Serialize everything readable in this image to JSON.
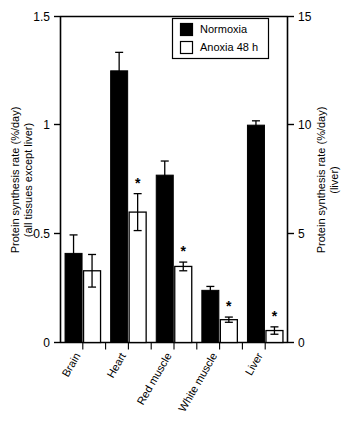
{
  "chart_data": {
    "type": "bar",
    "title": "",
    "xlabel": "",
    "ylabel": "Protein synthesis rate (%/day) (all tissues except liver)",
    "ylabel_line1": "Protein synthesis rate (%/day)",
    "ylabel_line2": "(all tissues except liver)",
    "y2label": "Protein synthesis rate (%/day) (liver)",
    "y2label_line1": "Protein synthesis rate (%/day)",
    "y2label_line2": "(liver)",
    "categories": [
      "Brain",
      "Heart",
      "Red muscle",
      "White muscle",
      "Liver"
    ],
    "ylim": [
      0,
      1.5
    ],
    "y2lim": [
      0,
      15
    ],
    "yticks": [
      "0",
      "0.5",
      "1",
      "1.5"
    ],
    "ytick_values": [
      0,
      0.5,
      1,
      1.5
    ],
    "y2ticks": [
      "0",
      "5",
      "10",
      "15"
    ],
    "y2tick_values": [
      0,
      5,
      10,
      15
    ],
    "grid": false,
    "legend_position": "top-right",
    "note": "Liver bars are plotted against the right-hand axis (0-15 %/day); all other tissues against the left-hand axis (0-1.5 %/day).",
    "series": [
      {
        "name": "Normoxia",
        "style": "filled",
        "color": "#000000",
        "values": [
          0.41,
          1.25,
          0.77,
          0.24,
          10.0
        ],
        "errors": [
          0.085,
          0.085,
          0.065,
          0.018,
          0.2
        ],
        "significance": [
          "",
          "",
          "",
          "",
          ""
        ]
      },
      {
        "name": "Anoxia 48 h",
        "style": "open",
        "color": "#ffffff",
        "values": [
          0.33,
          0.6,
          0.35,
          0.105,
          0.55
        ],
        "errors": [
          0.075,
          0.085,
          0.02,
          0.012,
          0.17
        ],
        "significance": [
          "",
          "*",
          "*",
          "*",
          "*"
        ]
      }
    ],
    "liver_series_axis": "right",
    "legend": [
      {
        "label": "Normoxia",
        "swatch": "filled-square"
      },
      {
        "label": "Anoxia 48 h",
        "swatch": "open-square"
      }
    ],
    "annotations": [
      {
        "text": "*",
        "meaning": "significantly different from normoxia"
      }
    ]
  }
}
